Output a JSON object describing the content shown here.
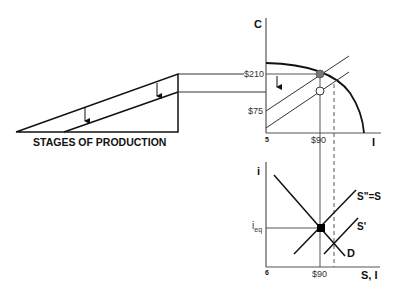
{
  "colors": {
    "ink": "#111111",
    "guide": "#555555",
    "point_filled_gray": "#777777",
    "point_open": "#ffffff",
    "point_black": "#000000",
    "background": "#ffffff"
  },
  "stages_panel": {
    "caption": "STAGES OF PRODUCTION",
    "arrows": 2
  },
  "upper_chart": {
    "y_axis_label": "C",
    "x_axis_label": "I",
    "panel_number": "5",
    "y_ticks": [
      "$210",
      "$75"
    ],
    "x_ticks": [
      "$90"
    ],
    "curves": [
      "production-possibilities-frontier",
      "budget-line-upper",
      "budget-line-lower"
    ],
    "points": [
      "initial-point-filled",
      "new-point-open"
    ]
  },
  "lower_chart": {
    "y_axis_label": "i",
    "x_axis_label": "S, I",
    "panel_number": "6",
    "y_ticks": [
      "i",
      "eq"
    ],
    "x_ticks": [
      "$90"
    ],
    "curve_labels": {
      "supply_combined": "S\"=S",
      "supply_shifted": "S'",
      "demand": "D"
    },
    "points": [
      "equilibrium-point"
    ]
  }
}
